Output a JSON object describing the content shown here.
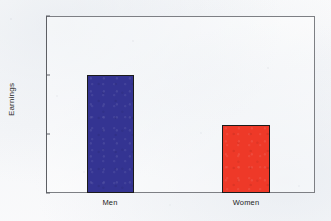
{
  "chart_data": {
    "type": "bar",
    "title": "",
    "subtitle": "",
    "xlabel": "",
    "ylabel": "Earnings",
    "categories": [
      "Men",
      "Women"
    ],
    "values": [
      100,
      83
    ],
    "series": [
      {
        "name": "Earnings",
        "values": [
          100,
          83
        ],
        "colors": [
          "#2e2e8f",
          "#ee3322"
        ]
      }
    ],
    "ylim": [
      60,
      120
    ],
    "yticks": [
      60,
      80,
      100,
      120
    ],
    "ytick_labels": [
      "60",
      "80",
      "100",
      "120"
    ],
    "grid": false,
    "legend": false,
    "legend_position": "none",
    "bar_edge_color": "#1b1b1b",
    "frame_color": "#7d7f84",
    "background_color": "#ffffff"
  },
  "axes": {
    "y_title": "Earnings",
    "ticks": [
      {
        "label": "120",
        "value": 120
      },
      {
        "label": "100",
        "value": 100
      },
      {
        "label": "80",
        "value": 80
      },
      {
        "label": "60",
        "value": 60
      }
    ]
  },
  "bars": [
    {
      "label": "Men",
      "value": 100,
      "color": "#2e2e8f"
    },
    {
      "label": "Women",
      "value": 83,
      "color": "#ee3322"
    }
  ]
}
